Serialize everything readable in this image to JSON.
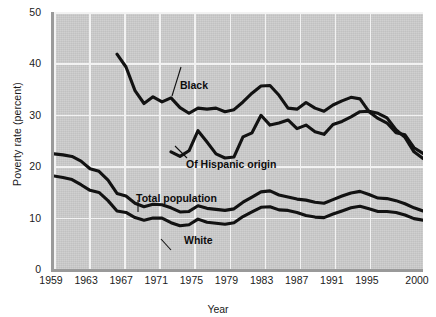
{
  "chart_data": {
    "type": "line",
    "title": "",
    "xlabel": "Year",
    "ylabel": "Poverty rate (percent)",
    "xlim": [
      1959,
      2000
    ],
    "ylim": [
      0,
      50
    ],
    "ytick_values": [
      0,
      10,
      20,
      30,
      40,
      50
    ],
    "ytick_labels": [
      "0",
      "10",
      "20",
      "30",
      "40",
      "50"
    ],
    "xtick_values": [
      1959,
      1963,
      1967,
      1971,
      1975,
      1979,
      1983,
      1987,
      1991,
      1995,
      2000
    ],
    "xtick_labels": [
      "1959",
      "1963",
      "1967",
      "1971",
      "1975",
      "1979",
      "1983",
      "1987",
      "1991",
      "1995",
      "2000"
    ],
    "grid": "white gridlines, horizontal at every y tick and vertical at every x tick",
    "legend_position": "inline annotations with leader lines",
    "plot_background": "#cccccc",
    "line_color": "#121212",
    "series": [
      {
        "name": "Black",
        "label": "Black",
        "x": [
          1966,
          1967,
          1968,
          1969,
          1970,
          1971,
          1972,
          1973,
          1974,
          1975,
          1976,
          1977,
          1978,
          1979,
          1980,
          1981,
          1982,
          1983,
          1984,
          1985,
          1986,
          1987,
          1988,
          1989,
          1990,
          1991,
          1992,
          1993,
          1994,
          1995,
          1996,
          1997,
          1998,
          1999,
          2000
        ],
        "values": [
          41.8,
          39.3,
          34.7,
          32.2,
          33.5,
          32.5,
          33.3,
          31.4,
          30.3,
          31.3,
          31.1,
          31.3,
          30.6,
          31.0,
          32.5,
          34.2,
          35.6,
          35.7,
          33.8,
          31.3,
          31.1,
          32.4,
          31.3,
          30.7,
          31.9,
          32.7,
          33.4,
          33.1,
          30.6,
          29.3,
          28.4,
          26.5,
          26.1,
          23.6,
          22.5
        ]
      },
      {
        "name": "Of Hispanic origin",
        "label": "Of Hispanic origin",
        "x": [
          1972,
          1973,
          1974,
          1975,
          1976,
          1977,
          1978,
          1979,
          1980,
          1981,
          1982,
          1983,
          1984,
          1985,
          1986,
          1987,
          1988,
          1989,
          1990,
          1991,
          1992,
          1993,
          1994,
          1995,
          1996,
          1997,
          1998,
          1999,
          2000
        ],
        "values": [
          22.8,
          21.9,
          23.0,
          26.9,
          24.7,
          22.4,
          21.6,
          21.8,
          25.7,
          26.5,
          29.9,
          28.0,
          28.4,
          29.0,
          27.3,
          28.0,
          26.7,
          26.2,
          28.1,
          28.7,
          29.6,
          30.6,
          30.7,
          30.3,
          29.4,
          27.1,
          25.6,
          22.8,
          21.5
        ]
      },
      {
        "name": "Total population",
        "label": "Total population",
        "x": [
          1959,
          1960,
          1961,
          1962,
          1963,
          1964,
          1965,
          1966,
          1967,
          1968,
          1969,
          1970,
          1971,
          1972,
          1973,
          1974,
          1975,
          1976,
          1977,
          1978,
          1979,
          1980,
          1981,
          1982,
          1983,
          1984,
          1985,
          1986,
          1987,
          1988,
          1989,
          1990,
          1991,
          1992,
          1993,
          1994,
          1995,
          1996,
          1997,
          1998,
          1999,
          2000
        ],
        "values": [
          22.4,
          22.2,
          21.9,
          21.0,
          19.5,
          19.0,
          17.3,
          14.7,
          14.2,
          12.8,
          12.1,
          12.6,
          12.5,
          11.9,
          11.1,
          11.2,
          12.3,
          11.8,
          11.6,
          11.4,
          11.7,
          13.0,
          14.0,
          15.0,
          15.2,
          14.4,
          14.0,
          13.6,
          13.4,
          13.0,
          12.8,
          13.5,
          14.2,
          14.8,
          15.1,
          14.5,
          13.8,
          13.7,
          13.3,
          12.7,
          11.9,
          11.3
        ]
      },
      {
        "name": "White",
        "label": "White",
        "x": [
          1959,
          1960,
          1961,
          1962,
          1963,
          1964,
          1965,
          1966,
          1967,
          1968,
          1969,
          1970,
          1971,
          1972,
          1973,
          1974,
          1975,
          1976,
          1977,
          1978,
          1979,
          1980,
          1981,
          1982,
          1983,
          1984,
          1985,
          1986,
          1987,
          1988,
          1989,
          1990,
          1991,
          1992,
          1993,
          1994,
          1995,
          1996,
          1997,
          1998,
          1999,
          2000
        ],
        "values": [
          18.1,
          17.8,
          17.4,
          16.4,
          15.3,
          14.9,
          13.3,
          11.3,
          11.0,
          10.0,
          9.5,
          9.9,
          9.9,
          9.0,
          8.4,
          8.6,
          9.7,
          9.1,
          8.9,
          8.7,
          9.0,
          10.2,
          11.1,
          12.0,
          12.1,
          11.5,
          11.4,
          11.0,
          10.4,
          10.1,
          10.0,
          10.7,
          11.3,
          11.9,
          12.2,
          11.7,
          11.2,
          11.2,
          11.0,
          10.5,
          9.8,
          9.5
        ]
      }
    ],
    "annotations": [
      {
        "text": "Black",
        "series": "Black"
      },
      {
        "text": "Of Hispanic origin",
        "series": "Of Hispanic origin"
      },
      {
        "text": "Total population",
        "series": "Total population"
      },
      {
        "text": "White",
        "series": "White"
      }
    ]
  }
}
